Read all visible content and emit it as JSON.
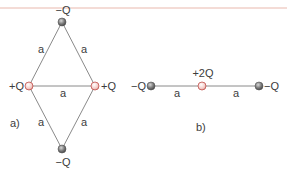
{
  "colors": {
    "negative_charge": "#6b6b6b",
    "positive_charge": "#f2c4c0",
    "positive_stroke": "#c0504d",
    "edge": "#8a8a8a",
    "text": "#3c3c3c",
    "top_rule": "#e9b8ad"
  },
  "diagram_a": {
    "label": "a)",
    "nodes": [
      {
        "id": "top",
        "charge": "−Q",
        "sign": "negative"
      },
      {
        "id": "left",
        "charge": "+Q",
        "sign": "positive"
      },
      {
        "id": "right",
        "charge": "+Q",
        "sign": "positive"
      },
      {
        "id": "bottom",
        "charge": "−Q",
        "sign": "negative"
      }
    ],
    "edges": [
      {
        "from": "top",
        "to": "left",
        "label": "a"
      },
      {
        "from": "top",
        "to": "right",
        "label": "a"
      },
      {
        "from": "left",
        "to": "right",
        "label": "a"
      },
      {
        "from": "left",
        "to": "bottom",
        "label": "a"
      },
      {
        "from": "right",
        "to": "bottom",
        "label": "a"
      }
    ]
  },
  "diagram_b": {
    "label": "b)",
    "nodes": [
      {
        "id": "left",
        "charge": "−Q",
        "sign": "negative"
      },
      {
        "id": "center",
        "charge": "+2Q",
        "sign": "positive"
      },
      {
        "id": "right",
        "charge": "−Q",
        "sign": "negative"
      }
    ],
    "edges": [
      {
        "from": "left",
        "to": "center",
        "label": "a"
      },
      {
        "from": "center",
        "to": "right",
        "label": "a"
      }
    ]
  }
}
